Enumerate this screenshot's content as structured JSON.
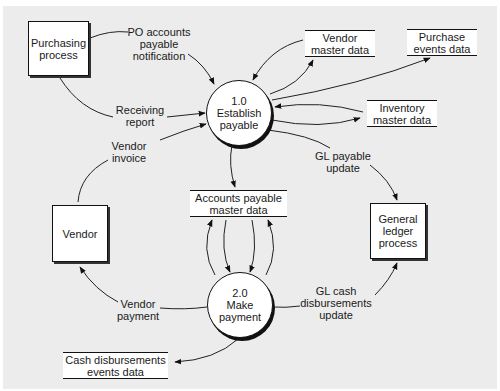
{
  "diagram": {
    "type": "data-flow-diagram",
    "background_color": "#ececec",
    "processes": [
      {
        "id": "1.0",
        "number": "1.0",
        "name": "Establish\npayable"
      },
      {
        "id": "2.0",
        "number": "2.0",
        "name": "Make\npayment"
      }
    ],
    "entities": [
      {
        "id": "purchasing",
        "label": "Purchasing\nprocess"
      },
      {
        "id": "vendor",
        "label": "Vendor"
      },
      {
        "id": "gl",
        "label": "General\nledger\nprocess"
      }
    ],
    "data_stores": [
      {
        "id": "vendor_master",
        "label": "Vendor\nmaster data"
      },
      {
        "id": "purchase_events",
        "label": "Purchase\nevents data"
      },
      {
        "id": "inventory_master",
        "label": "Inventory\nmaster data"
      },
      {
        "id": "ap_master",
        "label": "Accounts payable\nmaster data"
      },
      {
        "id": "cash_disb_events",
        "label": "Cash disbursements\nevents data"
      }
    ],
    "flow_labels": [
      {
        "id": "po_notification",
        "label": "PO accounts\npayable\nnotification"
      },
      {
        "id": "receiving_report",
        "label": "Receiving\nreport"
      },
      {
        "id": "vendor_invoice",
        "label": "Vendor\ninvoice"
      },
      {
        "id": "gl_payable_update",
        "label": "GL payable\nupdate"
      },
      {
        "id": "vendor_payment",
        "label": "Vendor\npayment"
      },
      {
        "id": "gl_cash_update",
        "label": "GL cash\ndisbursements\nupdate"
      }
    ],
    "flows": [
      {
        "from": "purchasing",
        "to": "1.0",
        "label": "PO accounts payable notification"
      },
      {
        "from": "purchasing",
        "to": "1.0",
        "label": "Receiving report"
      },
      {
        "from": "vendor",
        "to": "1.0",
        "label": "Vendor invoice"
      },
      {
        "from": "vendor_master",
        "to": "1.0",
        "label": ""
      },
      {
        "from": "1.0",
        "to": "vendor_master",
        "label": ""
      },
      {
        "from": "1.0",
        "to": "purchase_events",
        "label": ""
      },
      {
        "from": "inventory_master",
        "to": "1.0",
        "label": ""
      },
      {
        "from": "1.0",
        "to": "inventory_master",
        "label": ""
      },
      {
        "from": "1.0",
        "to": "gl",
        "label": "GL payable update"
      },
      {
        "from": "1.0",
        "to": "ap_master",
        "label": ""
      },
      {
        "from": "ap_master",
        "to": "2.0",
        "label": ""
      },
      {
        "from": "2.0",
        "to": "ap_master",
        "label": ""
      },
      {
        "from": "2.0",
        "to": "vendor",
        "label": "Vendor payment"
      },
      {
        "from": "2.0",
        "to": "gl",
        "label": "GL cash disbursements update"
      },
      {
        "from": "2.0",
        "to": "cash_disb_events",
        "label": ""
      }
    ]
  }
}
